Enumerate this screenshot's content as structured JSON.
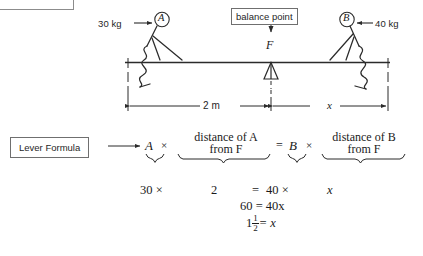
{
  "figure": {
    "title_box_clipped": "",
    "balance_point_label": "balance point",
    "fulcrum_label": "F",
    "left_person_label": "A",
    "right_person_label": "B",
    "left_mass": "30 kg",
    "right_mass": "40 kg",
    "left_distance": "2 m",
    "right_distance": "x"
  },
  "formula": {
    "callout_label": "Lever Formula",
    "term_a": "A",
    "times_1": "×",
    "phrase_a_line1": "distance of A",
    "phrase_a_line2": "from F",
    "equals": "=",
    "term_b": "B",
    "times_2": "×",
    "phrase_b_line1": "distance of B",
    "phrase_b_line2": "from F"
  },
  "work": {
    "line1": {
      "a_value": "30 ×",
      "dist_a": "2",
      "equals": "=",
      "b_value": "40 ×",
      "dist_b": "x"
    },
    "line2": "60 = 40x",
    "line3_whole": "1",
    "line3_num": "1",
    "line3_den": "2",
    "line3_tail": "= x"
  },
  "colors": {
    "ink": "#1a1a1a",
    "line": "#2b2b2b",
    "box_border": "#6f6f6f",
    "background": "#ffffff"
  }
}
